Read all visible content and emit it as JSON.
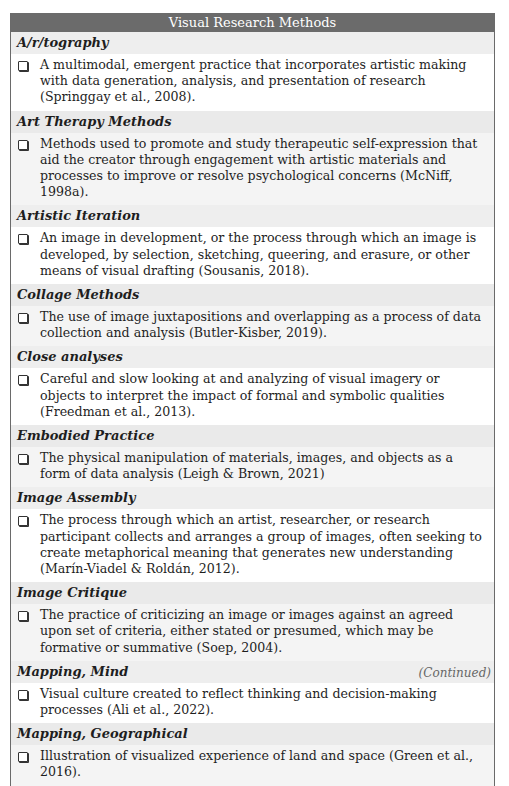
{
  "table": {
    "title": "Visual Research Methods",
    "sections": [
      {
        "heading": "A/r/tography",
        "entries": [
          "A multimodal, emergent practice that incorporates artistic making with data generation, analysis, and presentation of research (Springgay et al., 2008)."
        ]
      },
      {
        "heading": "Art Therapy Methods",
        "entries": [
          "Methods used to promote and study therapeutic self-expression that aid the creator through engagement with artistic materials and processes to improve or resolve psychological concerns (McNiff, 1998a)."
        ]
      },
      {
        "heading": "Artistic Iteration",
        "entries": [
          "An image in development, or the process through which an image is developed, by selection, sketching, queering, and erasure, or other means of visual drafting (Sousanis, 2018)."
        ]
      },
      {
        "heading": "Collage Methods",
        "entries": [
          "The use of image juxtapositions and overlapping as a process of data collection and analysis (Butler-Kisber, 2019)."
        ]
      },
      {
        "heading": "Close analyses",
        "entries": [
          "Careful and slow looking at and analyzing of visual imagery or objects to interpret the impact of formal and symbolic qualities (Freedman et al., 2013)."
        ]
      },
      {
        "heading": "Embodied Practice",
        "entries": [
          "The physical manipulation of materials, images, and objects as a form of data analysis (Leigh & Brown, 2021)"
        ]
      },
      {
        "heading": "Image Assembly",
        "entries": [
          "The process through which an artist, researcher, or research participant collects and arranges a group of images, often seeking to create metaphorical meaning that generates new understanding (Marín-Viadel & Roldán, 2012)."
        ]
      },
      {
        "heading": "Image Critique",
        "entries": [
          "The practice of criticizing an image or images against an agreed upon set of criteria, either stated or presumed, which may be formative or summative (Soep, 2004)."
        ]
      },
      {
        "heading": "Mapping, Mind",
        "entries": [
          "Visual culture created to reflect thinking and decision-making processes (Ali et al., 2022)."
        ]
      },
      {
        "heading": "Mapping, Geographical",
        "entries": [
          "Illustration of visualized experience of land and space (Green et al., 2016)."
        ]
      }
    ],
    "continued_label": "(Continued)"
  }
}
